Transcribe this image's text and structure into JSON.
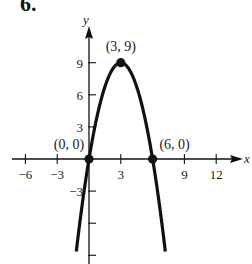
{
  "problem_number": "6.",
  "chart_data": {
    "type": "line",
    "title": "",
    "function": "y = -x^2 + 6x",
    "xlabel": "x",
    "ylabel": "y",
    "xlim": [
      -7.5,
      14.5
    ],
    "ylim": [
      -10,
      11.5
    ],
    "grid": false,
    "x_ticks": [
      -6,
      -3,
      3,
      9,
      12
    ],
    "x_tick_labels": [
      "−6",
      "−3",
      "3",
      "9",
      "12"
    ],
    "y_ticks": [
      9,
      6,
      3,
      -3,
      -6,
      -9
    ],
    "y_tick_labels": [
      "9",
      "6",
      "3",
      "−3",
      "",
      ""
    ],
    "series": [
      {
        "name": "parabola",
        "x": [
          -1,
          0,
          1,
          2,
          3,
          4,
          5,
          6,
          7
        ],
        "y": [
          -7,
          0,
          5,
          8,
          9,
          8,
          5,
          0,
          -7
        ]
      }
    ],
    "annotations": [
      {
        "label": "(3, 9)",
        "x": 3,
        "y": 9,
        "note": "vertex"
      },
      {
        "label": "(0, 0)",
        "x": 0,
        "y": 0,
        "note": "x-intercept"
      },
      {
        "label": "(6, 0)",
        "x": 6,
        "y": 0,
        "note": "x-intercept"
      }
    ]
  },
  "colors": {
    "ink": "#111111",
    "background": "#ffffff"
  }
}
